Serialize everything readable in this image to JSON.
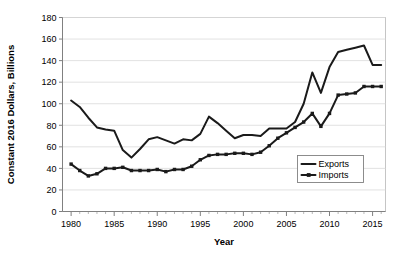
{
  "chart_data": {
    "type": "line",
    "title": "",
    "xlabel": "Year",
    "ylabel": "Constant 2016 Dollars, Billions",
    "xlim": [
      1979,
      2016.5
    ],
    "ylim": [
      0,
      180
    ],
    "ytick_step": 20,
    "yticks": [
      0,
      20,
      40,
      60,
      80,
      100,
      120,
      140,
      160,
      180
    ],
    "ytick_labels": [
      "0",
      "20",
      "40",
      "60",
      "80",
      "100",
      "120",
      "140",
      "160",
      "180"
    ],
    "xticks_major": [
      1980,
      1985,
      1990,
      1995,
      2000,
      2005,
      2010,
      2015
    ],
    "xtick_labels": [
      "1980",
      "1985",
      "1990",
      "1995",
      "2000",
      "2005",
      "2010",
      "2015"
    ],
    "xtick_minor_step": 1,
    "grid": "horizontal",
    "legend_position": "inside-lower-right",
    "x": [
      1980,
      1981,
      1982,
      1983,
      1984,
      1985,
      1986,
      1987,
      1988,
      1989,
      1990,
      1991,
      1992,
      1993,
      1994,
      1995,
      1996,
      1997,
      1998,
      1999,
      2000,
      2001,
      2002,
      2003,
      2004,
      2005,
      2006,
      2007,
      2008,
      2009,
      2010,
      2011,
      2012,
      2013,
      2014,
      2015,
      2016
    ],
    "series": [
      {
        "name": "Exports",
        "marker": "none",
        "color": "#1a1a1a",
        "values": [
          103,
          97,
          87,
          78,
          76,
          75,
          57,
          50,
          58,
          67,
          69,
          66,
          63,
          67,
          66,
          72,
          88,
          82,
          75,
          68,
          71,
          71,
          70,
          77,
          77,
          77,
          83,
          100,
          129,
          110,
          134,
          148,
          150,
          152,
          154,
          136,
          136
        ]
      },
      {
        "name": "Imports",
        "marker": "square",
        "color": "#1a1a1a",
        "values": [
          44,
          38,
          33,
          35,
          40,
          40,
          41,
          38,
          38,
          38,
          39,
          37,
          39,
          39,
          42,
          48,
          52,
          53,
          53,
          54,
          54,
          53,
          55,
          61,
          68,
          73,
          78,
          83,
          91,
          79,
          91,
          108,
          109,
          110,
          116,
          116,
          116
        ]
      }
    ]
  },
  "legend": {
    "entries": [
      {
        "label": "Exports",
        "marker": "none"
      },
      {
        "label": "Imports",
        "marker": "square"
      }
    ]
  }
}
